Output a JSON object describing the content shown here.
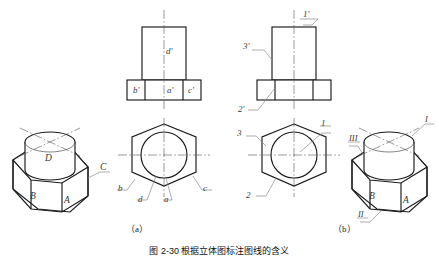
{
  "figure": {
    "caption": "图 2-30  根据立体图标注图线的含义",
    "sub_labels": {
      "a": "（a）",
      "b": "（b）"
    }
  },
  "panel_a": {
    "name": "sub-figure-a",
    "iso_view": {
      "name": "isometric-view-a",
      "face_labels": [
        "D",
        "C",
        "B",
        "A"
      ]
    },
    "front_view": {
      "name": "front-view-a",
      "labels": [
        "d'",
        "b'",
        "a'",
        "c'"
      ]
    },
    "top_view": {
      "name": "top-view-a",
      "labels": [
        "b",
        "d",
        "a",
        "c"
      ]
    }
  },
  "panel_b": {
    "name": "sub-figure-b",
    "front_view": {
      "name": "front-view-b",
      "labels": [
        "1'",
        "3'",
        "2'"
      ]
    },
    "top_view": {
      "name": "top-view-b",
      "labels": [
        "3",
        "1",
        "2"
      ]
    },
    "iso_view": {
      "name": "isometric-view-b",
      "labels": [
        "I",
        "III",
        "II",
        "B",
        "A"
      ]
    }
  },
  "colors": {
    "outline": "#1a1a1a",
    "thin": "#555555",
    "center": "#444444",
    "leader": "#7a7a7a",
    "text": "#2b2b2b",
    "background": "#ffffff"
  }
}
